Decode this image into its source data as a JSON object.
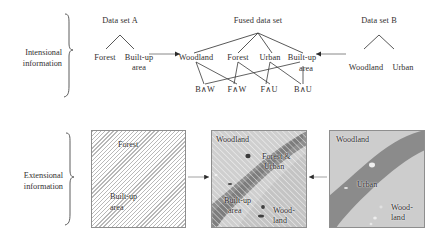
{
  "figure": {
    "rows": [
      {
        "id": "intensional",
        "brace_label_line1": "Intensional",
        "brace_label_line2": "information"
      },
      {
        "id": "extensional",
        "brace_label_line1": "Extensional",
        "brace_label_line2": "information"
      }
    ]
  },
  "intensional": {
    "dataset_a": {
      "title": "Data set A",
      "leaves": [
        "Forest",
        "Built-up",
        "area"
      ]
    },
    "fused": {
      "title": "Fused data set",
      "level1": [
        "Woodland",
        "Forest",
        "Urban",
        "Built-up",
        "area"
      ],
      "level2": [
        "B∧W",
        "F∧W",
        "F∧U",
        "B∧U"
      ]
    },
    "dataset_b": {
      "title": "Data set B",
      "leaves": [
        "Woodland",
        "Urban"
      ]
    }
  },
  "extensional": {
    "panel_a": {
      "labels": [
        "Forest",
        "Built-up",
        "area"
      ]
    },
    "panel_fused": {
      "labels": [
        "Woodland",
        "Forest &",
        "Urban",
        "Built-up",
        "area",
        "Wood-",
        "land"
      ]
    },
    "panel_b": {
      "labels": [
        "Woodland",
        "Urban",
        "Wood-",
        "land"
      ]
    }
  },
  "colors": {
    "ink": "#333030",
    "line": "#6f6f6f",
    "hatch": "#b8b8b8",
    "panel_border": "#8e8e8e",
    "light_gray": "#c9c9c9",
    "mid_gray": "#9b9b9b",
    "dark_gray": "#7a7a7a",
    "white": "#ffffff"
  }
}
